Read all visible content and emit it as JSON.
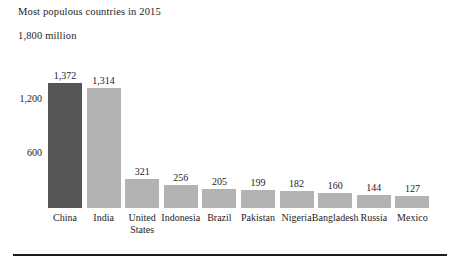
{
  "chart_data": {
    "type": "bar",
    "title": "Most populous countries in 2015",
    "subtitle": "1,800 million",
    "xlabel": "",
    "ylabel": "",
    "ylim": [
      0,
      1800
    ],
    "grid": false,
    "legend": null,
    "ytick_labels": [
      "1,200",
      "600"
    ],
    "ytick_values": [
      1200,
      600
    ],
    "categories": [
      "China",
      "India",
      "United States",
      "Indonesia",
      "Brazil",
      "Pakistan",
      "Nigeria",
      "Bangladesh",
      "Russia",
      "Mexico"
    ],
    "values": [
      1372,
      1314,
      321,
      256,
      205,
      199,
      182,
      160,
      144,
      127
    ],
    "value_labels": [
      "1,372",
      "1,314",
      "321",
      "256",
      "205",
      "199",
      "182",
      "160",
      "144",
      "127"
    ],
    "bar_colors": [
      "#565656",
      "#b3b3b3",
      "#b3b3b3",
      "#b3b3b3",
      "#b3b3b3",
      "#b3b3b3",
      "#b3b3b3",
      "#b3b3b3",
      "#b3b3b3",
      "#b3b3b3"
    ],
    "highlight_index": 0,
    "units": "million"
  },
  "colors": {
    "highlight_bar": "#565656",
    "default_bar": "#b3b3b3",
    "text": "#242424",
    "rule": "#1d1d1d",
    "background": "#ffffff"
  }
}
